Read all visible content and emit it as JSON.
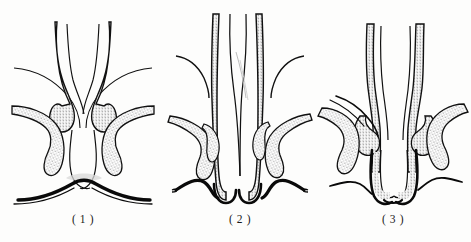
{
  "plate": {
    "title": "Anal canal cross-section series",
    "background_color": "#fdfdfc",
    "ink_color": "#111111",
    "stipple_color": "#6b6b6b",
    "width": 471,
    "height": 242
  },
  "panels": [
    {
      "id": "panel-1",
      "caption": "( 1 )",
      "caption_x": 83,
      "caption_y": 220,
      "center_x": 83,
      "description": "Everted mucosal folds with bilateral cushions, wide open canal outlet"
    },
    {
      "id": "panel-2",
      "caption": "( 2 )",
      "caption_x": 240,
      "caption_y": 220,
      "center_x": 240,
      "description": "Narrow vertical canal with descending elongated cushions"
    },
    {
      "id": "panel-3",
      "caption": "( 3 )",
      "caption_x": 393,
      "caption_y": 220,
      "center_x": 393,
      "description": "Canal with prolapsed folds and laterally splayed cushions"
    }
  ]
}
